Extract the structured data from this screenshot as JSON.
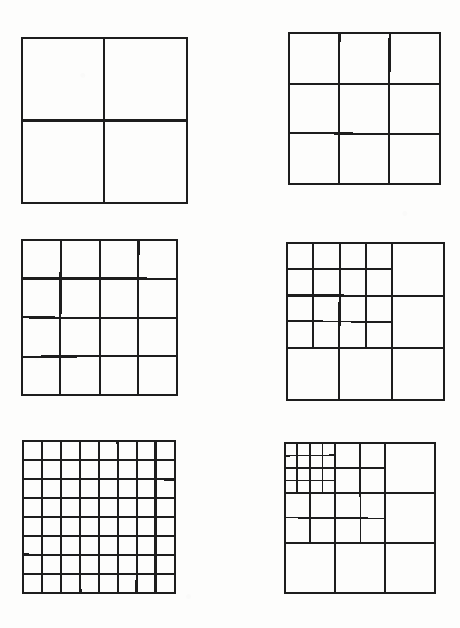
{
  "page": {
    "background_color": "#fdfdfc",
    "ink_color": "#1d1d1d",
    "width": 460,
    "height": 628
  },
  "figures": [
    {
      "id": "figure-1",
      "name": "square-2x2",
      "caption": "2 x 2 uniform grid",
      "x": 22,
      "y": 38,
      "size": 165,
      "type": "uniform",
      "divisions": 2,
      "cells": 4,
      "recursion_depth": 0
    },
    {
      "id": "figure-2",
      "name": "square-3x3",
      "caption": "3 x 3 uniform grid",
      "x": 289,
      "y": 33,
      "size": 151,
      "type": "uniform",
      "divisions": 3,
      "cells": 9,
      "recursion_depth": 0
    },
    {
      "id": "figure-3",
      "name": "square-4x4",
      "caption": "4 x 4 uniform grid",
      "x": 22,
      "y": 240,
      "size": 155,
      "type": "uniform",
      "divisions": 4,
      "cells": 16,
      "recursion_depth": 0
    },
    {
      "id": "figure-4",
      "name": "square-3x3-recursive-depth-1",
      "caption": "3 x 3 grid with top-left 2x2 block subdivided into 4 x 4",
      "x": 287,
      "y": 243,
      "size": 157,
      "type": "recursive",
      "divisions": 3,
      "sub_divisions": 4,
      "sub_block_span": 2,
      "recursion_depth": 1
    },
    {
      "id": "figure-5",
      "name": "square-8x8",
      "caption": "8 x 8 uniform grid",
      "x": 23,
      "y": 441,
      "size": 152,
      "type": "uniform",
      "divisions": 8,
      "cells": 64,
      "recursion_depth": 0
    },
    {
      "id": "figure-6",
      "name": "square-3x3-recursive-depth-2",
      "caption": "3 x 3 grid, top-left 2x2 block subdivided into 4 x 4, and its top-left 2x2 block subdivided again into 4 x 4",
      "x": 285,
      "y": 443,
      "size": 150,
      "type": "recursive",
      "divisions": 3,
      "sub_divisions": 4,
      "sub_block_span": 2,
      "recursion_depth": 2
    }
  ],
  "chart_data": {
    "type": "diagram",
    "columns": [
      {
        "name": "uniform-series",
        "label": "Uniform subdivisions",
        "items": [
          "2 x 2",
          "4 x 4",
          "8 x 8"
        ],
        "cell_counts": [
          4,
          16,
          64
        ]
      },
      {
        "name": "recursive-series",
        "label": "Recursive subdivisions of a 3 x 3 square",
        "items": [
          "3 x 3",
          "3 x 3 + 4 x 4 inset",
          "3 x 3 + 4 x 4 + 4 x 4 inset"
        ],
        "recursion_depths": [
          0,
          1,
          2
        ]
      }
    ]
  }
}
